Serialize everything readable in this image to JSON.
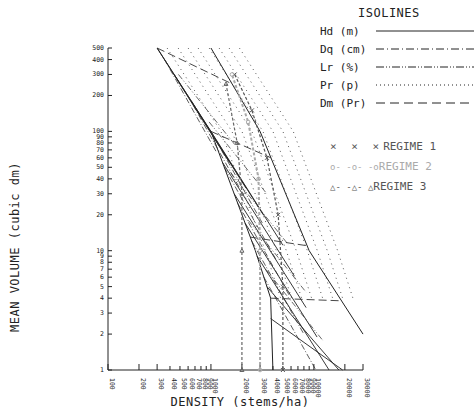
{
  "chart_data": {
    "type": "line",
    "title": "",
    "xlabel": "DENSITY (stems/ha)",
    "ylabel": "MEAN VOLUME (cubic dm)",
    "x_scale": "log",
    "y_scale": "log",
    "xlim": [
      100,
      30000
    ],
    "ylim": [
      1,
      500
    ],
    "x_ticks": [
      "100",
      "200",
      "300",
      "400",
      "500",
      "600",
      "700",
      "800",
      "900",
      "1000",
      "2000",
      "3000",
      "4000",
      "5000",
      "6000",
      "7000",
      "8000",
      "9000",
      "10000",
      "20000",
      "30000"
    ],
    "y_ticks": [
      "1",
      "2",
      "3",
      "4",
      "5",
      "6",
      "7",
      "8",
      "9",
      "10",
      "20",
      "30",
      "40",
      "50",
      "60",
      "70",
      "80",
      "90",
      "100",
      "200",
      "300",
      "400",
      "500"
    ],
    "grid": false,
    "legend_position": "upper right",
    "boundary_lines": [
      {
        "name": "upper self-thinning line",
        "points": [
          [
            300,
            500
          ],
          [
            1000,
            100
          ],
          [
            2700,
            10
          ],
          [
            3800,
            4
          ]
        ]
      },
      {
        "name": "upper edge line",
        "points": [
          [
            1000,
            500
          ],
          [
            3000,
            100
          ],
          [
            9000,
            10
          ],
          [
            30000,
            2
          ]
        ]
      }
    ],
    "isolines": {
      "title": "ISOLINES",
      "series": [
        {
          "name": "Hd (m)",
          "style": "solid"
        },
        {
          "name": "Dq (cm)",
          "style": "dash-dot"
        },
        {
          "name": "Lr (%)",
          "style": "dash-dot-dot"
        },
        {
          "name": "Pr (p)",
          "style": "dotted"
        },
        {
          "name": "Dm (Pr)",
          "style": "dashed"
        }
      ]
    },
    "regimes": [
      {
        "name": "REGIME 1",
        "marker": "x",
        "color": "#555555",
        "points": [
          [
            5000,
            1
          ],
          [
            5000,
            5
          ],
          [
            4500,
            20
          ],
          [
            3500,
            60
          ],
          [
            2500,
            150
          ],
          [
            1700,
            300
          ]
        ]
      },
      {
        "name": "REGIME 2",
        "marker": "o",
        "color": "#aaaaaa",
        "points": [
          [
            3000,
            1
          ],
          [
            3000,
            10
          ],
          [
            2900,
            40
          ],
          [
            2300,
            120
          ],
          [
            1600,
            300
          ]
        ]
      },
      {
        "name": "REGIME 3",
        "marker": "triangle",
        "color": "#666666",
        "points": [
          [
            2000,
            1
          ],
          [
            2000,
            10
          ],
          [
            2000,
            30
          ],
          [
            1800,
            80
          ],
          [
            1400,
            250
          ]
        ]
      }
    ]
  },
  "legend": {
    "title": "ISOLINES",
    "isolines": [
      {
        "label": "Hd (m)"
      },
      {
        "label": "Dq (cm)"
      },
      {
        "label": "Lr (%)"
      },
      {
        "label": "Pr (p)"
      },
      {
        "label": "Dm (Pr)"
      }
    ],
    "regimes": [
      {
        "label": "REGIME 1",
        "marker": "× × ×",
        "color": "#555555"
      },
      {
        "label": "REGIME 2",
        "marker": "o- -o- -o",
        "color": "#aaaaaa"
      },
      {
        "label": "REGIME 3",
        "marker": "△- -△- △",
        "color": "#555555"
      }
    ]
  },
  "axes": {
    "xlabel": "DENSITY (stems/ha)",
    "ylabel": "MEAN VOLUME (cubic dm)"
  }
}
